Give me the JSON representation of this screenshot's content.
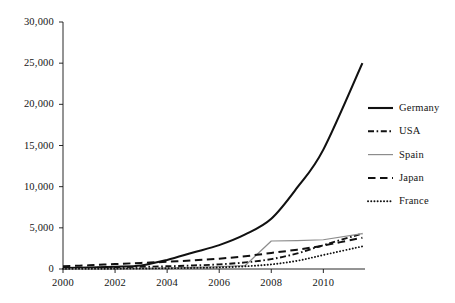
{
  "chart_data": {
    "type": "line",
    "title": "",
    "subtitle": "",
    "xlabel": "",
    "ylabel": "",
    "xlim": [
      2000,
      2011.6
    ],
    "ylim": [
      0,
      30000
    ],
    "grid": false,
    "legend_position": "right",
    "x": [
      2000,
      2001,
      2002,
      2003,
      2004,
      2005,
      2006,
      2007,
      2008,
      2009,
      2010,
      2011.5
    ],
    "xticks": [
      2000,
      2002,
      2004,
      2006,
      2008,
      2010
    ],
    "xtick_labels": [
      "2000",
      "2002",
      "2004",
      "2006",
      "2008",
      "2010"
    ],
    "yticks": [
      0,
      5000,
      10000,
      15000,
      20000,
      25000,
      30000
    ],
    "ytick_labels": [
      "0",
      "5,000",
      "10,000",
      "15,000",
      "20,000",
      "25,000",
      "30,000"
    ],
    "series": [
      {
        "name": "Germany",
        "style": "solid-thick",
        "color": "#111111",
        "values": [
          110,
          180,
          280,
          430,
          1100,
          2000,
          2900,
          4200,
          6100,
          9900,
          14500,
          25000
        ]
      },
      {
        "name": "USA",
        "style": "dash-dot",
        "color": "#111111",
        "values": [
          90,
          130,
          190,
          260,
          330,
          430,
          560,
          800,
          1200,
          1900,
          2900,
          4300
        ]
      },
      {
        "name": "Spain",
        "style": "solid-thin",
        "color": "#8c8c8c",
        "values": [
          30,
          45,
          60,
          90,
          140,
          200,
          280,
          420,
          3400,
          3450,
          3550,
          4300
        ]
      },
      {
        "name": "Japan",
        "style": "long-dash",
        "color": "#111111",
        "values": [
          330,
          450,
          600,
          740,
          880,
          1050,
          1250,
          1550,
          1950,
          2350,
          2850,
          3800
        ]
      },
      {
        "name": "France",
        "style": "dotted",
        "color": "#111111",
        "values": [
          20,
          30,
          40,
          60,
          90,
          130,
          190,
          330,
          560,
          1000,
          1700,
          2750
        ]
      }
    ],
    "legend_entries": [
      "Germany",
      "USA",
      "Spain",
      "Japan",
      "France"
    ]
  },
  "axes": {
    "y_labels": [
      "30,000",
      "25,000",
      "20,000",
      "15,000",
      "10,000",
      "5,000",
      "0"
    ],
    "x_labels": [
      "2000",
      "2002",
      "2004",
      "2006",
      "2008",
      "2010"
    ]
  },
  "legend": {
    "items": [
      {
        "label": "Germany"
      },
      {
        "label": "USA"
      },
      {
        "label": "Spain"
      },
      {
        "label": "Japan"
      },
      {
        "label": "France"
      }
    ]
  }
}
